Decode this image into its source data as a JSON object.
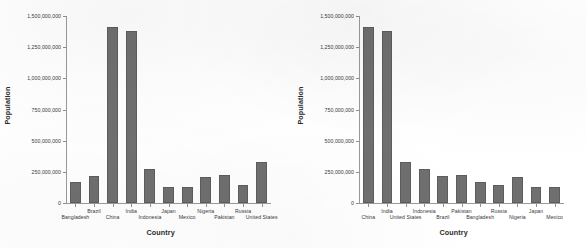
{
  "charts": [
    {
      "id": "left-chart",
      "axis_titles": {
        "x": "Country",
        "y": "Population"
      },
      "y_ticks": [
        "0",
        "250,000,000",
        "500,000,000",
        "750,000,000",
        "1,000,000,000",
        "1,250,000,000",
        "1,500,000,000"
      ]
    },
    {
      "id": "right-chart",
      "axis_titles": {
        "x": "Country",
        "y": "Population"
      },
      "y_ticks": [
        "0",
        "250,000,000",
        "500,000,000",
        "750,000,000",
        "1,000,000,000",
        "1,250,000,000",
        "1,500,000,000"
      ]
    }
  ],
  "chart_data": [
    {
      "type": "bar",
      "title": "",
      "xlabel": "Country",
      "ylabel": "Population",
      "ylim": [
        0,
        1500000000
      ],
      "yticks": [
        0,
        250000000,
        500000000,
        750000000,
        1000000000,
        1250000000,
        1500000000
      ],
      "ytick_labels": [
        "0",
        "250,000,000",
        "500,000,000",
        "750,000,000",
        "1,000,000,000",
        "1,250,000,000",
        "1,500,000,000"
      ],
      "grid": false,
      "legend": "none",
      "sort": "alphabetical-by-country",
      "categories": [
        "Bangladesh",
        "Brazil",
        "China",
        "India",
        "Indonesia",
        "Japan",
        "Mexico",
        "Nigeria",
        "Pakistan",
        "Russia",
        "United States"
      ],
      "values": [
        165000000,
        213000000,
        1412000000,
        1380000000,
        274000000,
        126000000,
        129000000,
        206000000,
        221000000,
        144000000,
        332000000
      ]
    },
    {
      "type": "bar",
      "title": "",
      "xlabel": "Country",
      "ylabel": "Population",
      "ylim": [
        0,
        1500000000
      ],
      "yticks": [
        0,
        250000000,
        500000000,
        750000000,
        1000000000,
        1250000000,
        1500000000
      ],
      "ytick_labels": [
        "0",
        "250,000,000",
        "500,000,000",
        "750,000,000",
        "1,000,000,000",
        "1,250,000,000",
        "1,500,000,000"
      ],
      "grid": false,
      "legend": "none",
      "sort": "descending-by-population",
      "categories": [
        "China",
        "India",
        "United States",
        "Indonesia",
        "Brazil",
        "Pakistan",
        "Bangladesh",
        "Russia",
        "Nigeria",
        "Japan",
        "Mexico"
      ],
      "values": [
        1412000000,
        1380000000,
        332000000,
        274000000,
        213000000,
        221000000,
        165000000,
        144000000,
        206000000,
        126000000,
        129000000
      ]
    }
  ],
  "style": {
    "bar_color": "#6f6f6f",
    "bar_edge_color": "#5d5d5d",
    "axis_color": "#9a9a9a",
    "text_color": "#3a3a3a",
    "background": "#ffffff"
  }
}
